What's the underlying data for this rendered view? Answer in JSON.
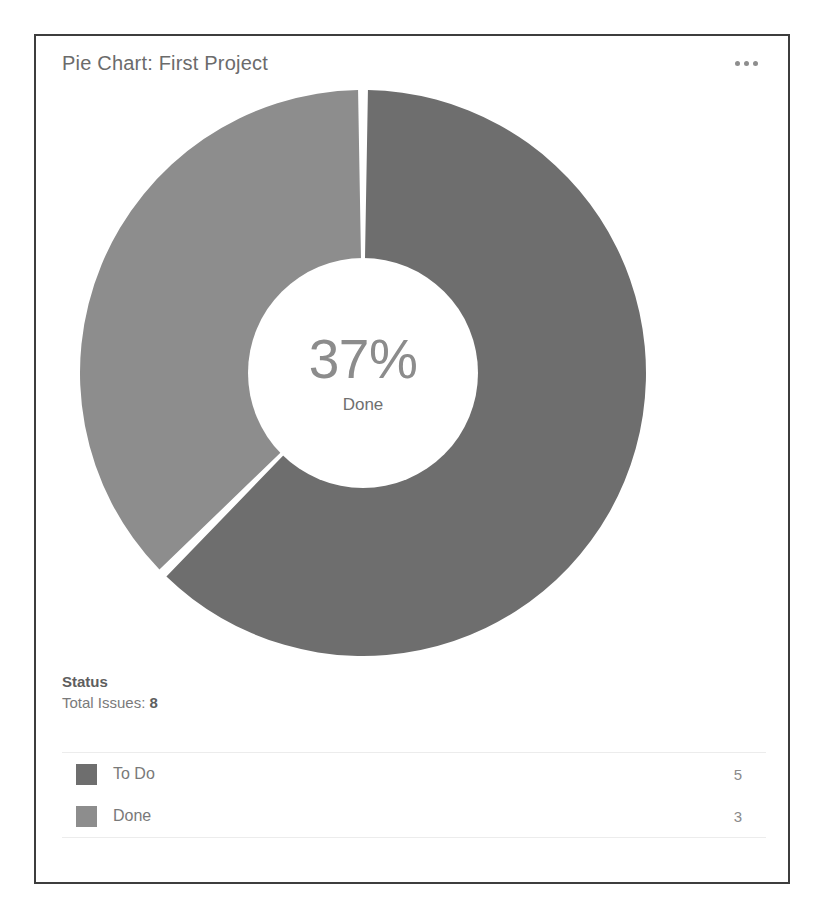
{
  "card": {
    "title": "Pie Chart: First Project",
    "menu_icon": "ellipsis-icon"
  },
  "donut": {
    "center_percent": "37%",
    "center_label": "Done"
  },
  "summary": {
    "label": "Status",
    "total_prefix": "Total Issues: ",
    "total_value": "8"
  },
  "legend": [
    {
      "label": "To Do",
      "value": "5",
      "color": "#6e6e6e"
    },
    {
      "label": "Done",
      "value": "3",
      "color": "#8d8d8d"
    }
  ],
  "colors": {
    "slice_todo": "#6e6e6e",
    "slice_done": "#8d8d8d",
    "separator": "#ffffff",
    "card_border": "#3d3d3d",
    "title_text": "#6b6b6b"
  },
  "chart_data": {
    "type": "pie",
    "title": "Pie Chart: First Project",
    "subtitle": "Status",
    "donut": true,
    "center_text": "37%",
    "center_subtext": "Done",
    "categories": [
      "To Do",
      "Done"
    ],
    "values": [
      5,
      3
    ],
    "percentages": [
      62.5,
      37.5
    ],
    "total": 8,
    "colors": [
      "#6e6e6e",
      "#8d8d8d"
    ],
    "start_angle_deg": 0,
    "direction": "clockwise",
    "legend_position": "bottom",
    "xlabel": "",
    "ylabel": ""
  }
}
